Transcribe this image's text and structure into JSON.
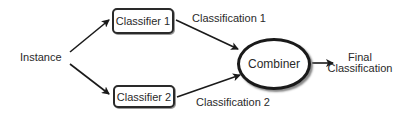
{
  "diagram": {
    "type": "flowchart",
    "nodes": {
      "instance": {
        "label": "Instance"
      },
      "classifier1": {
        "label": "Classifier 1"
      },
      "classifier2": {
        "label": "Classifier 2"
      },
      "combiner": {
        "label": "Combiner"
      },
      "final": {
        "line1": "Final",
        "line2": "Classification"
      }
    },
    "edges": [
      {
        "from": "instance",
        "to": "classifier1",
        "label": ""
      },
      {
        "from": "instance",
        "to": "classifier2",
        "label": ""
      },
      {
        "from": "classifier1",
        "to": "combiner",
        "label": "Classification 1"
      },
      {
        "from": "classifier2",
        "to": "combiner",
        "label": "Classification 2"
      },
      {
        "from": "combiner",
        "to": "final",
        "label": ""
      }
    ],
    "edge_labels": {
      "classification1": "Classification 1",
      "classification2": "Classification 2"
    },
    "colors": {
      "stroke": "#2a2a2a",
      "background": "#ffffff"
    }
  }
}
